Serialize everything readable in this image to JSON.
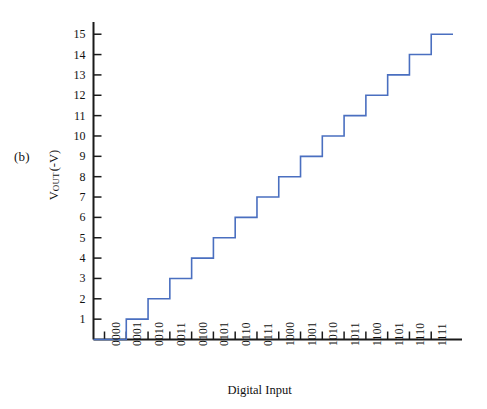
{
  "figure": {
    "panel_label": "(b)",
    "background_color": "#ffffff",
    "axis_color": "#1a1a1a",
    "line_color": "#4a6fc0"
  },
  "chart_data": {
    "type": "line",
    "line_style": "step-post",
    "title": "",
    "subtitle": "",
    "xlabel": "Digital Input",
    "ylabel": "V_OUT (-V)",
    "ylabel_parts": {
      "main": "V",
      "subscript": "OUT",
      "unit": "(-V)"
    },
    "categories": [
      "0000",
      "0001",
      "0010",
      "0011",
      "0100",
      "0101",
      "0110",
      "0111",
      "1000",
      "1001",
      "1010",
      "1011",
      "1100",
      "1101",
      "1110",
      "1111"
    ],
    "x": [
      0,
      1,
      2,
      3,
      4,
      5,
      6,
      7,
      8,
      9,
      10,
      11,
      12,
      13,
      14,
      15
    ],
    "values": [
      0,
      1,
      2,
      3,
      4,
      5,
      6,
      7,
      8,
      9,
      10,
      11,
      12,
      13,
      14,
      15
    ],
    "ytick_labels": [
      "1",
      "2",
      "3",
      "4",
      "5",
      "6",
      "7",
      "8",
      "9",
      "10",
      "11",
      "12",
      "13",
      "14",
      "15"
    ],
    "yticks": [
      1,
      2,
      3,
      4,
      5,
      6,
      7,
      8,
      9,
      10,
      11,
      12,
      13,
      14,
      15
    ],
    "ylim": [
      0,
      15.6
    ],
    "xlim": [
      -0.5,
      16.0
    ],
    "grid": false,
    "legend": false,
    "legend_position": "none",
    "annotations": [
      "(b)"
    ]
  }
}
